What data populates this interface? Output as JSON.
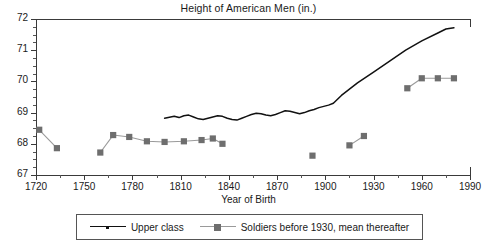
{
  "chart_data": {
    "type": "line",
    "title": "Height of American Men (in.)",
    "xlabel": "Year of Birth",
    "ylabel": "",
    "xlim": [
      1720,
      1990
    ],
    "ylim": [
      67,
      72
    ],
    "xticks": [
      1720,
      1750,
      1780,
      1810,
      1840,
      1870,
      1900,
      1930,
      1960,
      1990
    ],
    "xminor_step": 15,
    "yticks": [
      67,
      68,
      69,
      70,
      71,
      72
    ],
    "yminor_step": 0.25,
    "grid": false,
    "legend_position": "bottom",
    "series": [
      {
        "name": "Upper class",
        "color": "#111111",
        "marker": "none",
        "line": "solid",
        "x": [
          1800,
          1803,
          1806,
          1809,
          1812,
          1815,
          1818,
          1821,
          1824,
          1827,
          1830,
          1833,
          1836,
          1839,
          1842,
          1845,
          1848,
          1851,
          1854,
          1857,
          1860,
          1863,
          1866,
          1869,
          1872,
          1875,
          1878,
          1881,
          1884,
          1887,
          1890,
          1893,
          1896,
          1899,
          1902,
          1905,
          1910,
          1920,
          1930,
          1940,
          1950,
          1960,
          1970,
          1975,
          1980
        ],
        "y": [
          68.82,
          68.85,
          68.88,
          68.84,
          68.9,
          68.92,
          68.86,
          68.8,
          68.78,
          68.82,
          68.86,
          68.9,
          68.88,
          68.82,
          68.78,
          68.76,
          68.82,
          68.88,
          68.94,
          68.98,
          68.96,
          68.92,
          68.9,
          68.94,
          69.0,
          69.06,
          69.04,
          69.0,
          68.96,
          69.0,
          69.06,
          69.1,
          69.16,
          69.2,
          69.24,
          69.3,
          69.55,
          69.95,
          70.3,
          70.65,
          71.0,
          71.3,
          71.55,
          71.68,
          71.72
        ]
      },
      {
        "name": "Soldiers before 1930, mean thereafter",
        "color": "#6e6e6e",
        "marker": "square",
        "line": "solid",
        "segments": [
          {
            "x": [
              1722,
              1733
            ],
            "y": [
              68.45,
              67.86
            ]
          },
          {
            "x": [
              1760,
              1768,
              1778,
              1789,
              1800,
              1812,
              1823,
              1830,
              1836
            ],
            "y": [
              67.72,
              68.28,
              68.22,
              68.08,
              68.06,
              68.08,
              68.12,
              68.17,
              68.0
            ]
          },
          {
            "x": [
              1892
            ],
            "y": [
              67.62
            ]
          },
          {
            "x": [
              1915,
              1924
            ],
            "y": [
              67.95,
              68.25
            ]
          },
          {
            "x": [
              1951,
              1960,
              1970,
              1980
            ],
            "y": [
              69.78,
              70.1,
              70.1,
              70.1
            ]
          }
        ]
      }
    ]
  },
  "legend": {
    "entries": [
      {
        "label": "Upper class"
      },
      {
        "label": "Soldiers before 1930, mean thereafter"
      }
    ]
  },
  "axes": {
    "x_title": "Year of Birth"
  }
}
